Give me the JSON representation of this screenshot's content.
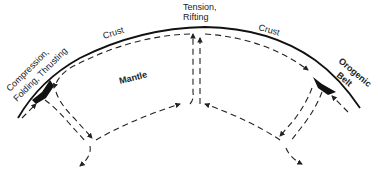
{
  "diagram": {
    "type": "mantle convection cross-section",
    "labels": {
      "crust_left": "Crust",
      "crust_right": "Crust",
      "mantle": "Mantle",
      "tension_line1": "Tension,",
      "tension_line2": "Rifting",
      "compression_line1": "Compression,",
      "compression_line2": "Folding, Thrusting",
      "orogenic_line1": "Orogenic",
      "orogenic_line2": "Belt"
    },
    "colors": {
      "line": "#111111",
      "background": "#ffffff"
    }
  }
}
